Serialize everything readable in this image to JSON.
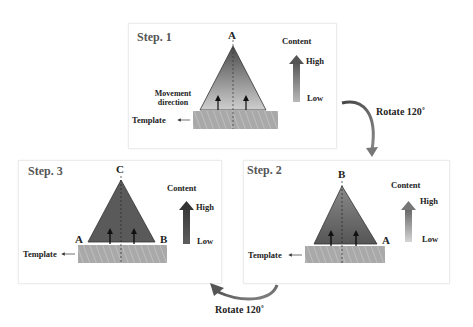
{
  "diagram": {
    "steps": [
      {
        "title": "Step. 1",
        "apex_label": "A",
        "left_label": "",
        "right_label": "",
        "movement_label": "Movement direction",
        "template_label": "Template",
        "content_label": "Content",
        "high_label": "High",
        "low_label": "Low"
      },
      {
        "title": "Step. 2",
        "apex_label": "B",
        "right_label": "A",
        "template_label": "Template",
        "content_label": "Content",
        "high_label": "High",
        "low_label": "Low"
      },
      {
        "title": "Step. 3",
        "apex_label": "C",
        "left_label": "A",
        "right_label": "B",
        "template_label": "Template",
        "content_label": "Content",
        "high_label": "High",
        "low_label": "Low"
      }
    ],
    "rotations": [
      {
        "label": "Rotate 120˚"
      },
      {
        "label": "Rotate 120˚"
      }
    ],
    "colors": {
      "step1_top": "#555555",
      "step1_bottom": "#c8c8c8",
      "step2_fill": "#6e6e6e",
      "step3_fill": "#5a5a5a",
      "template": "#a8a8a8",
      "text": "#222222"
    }
  }
}
